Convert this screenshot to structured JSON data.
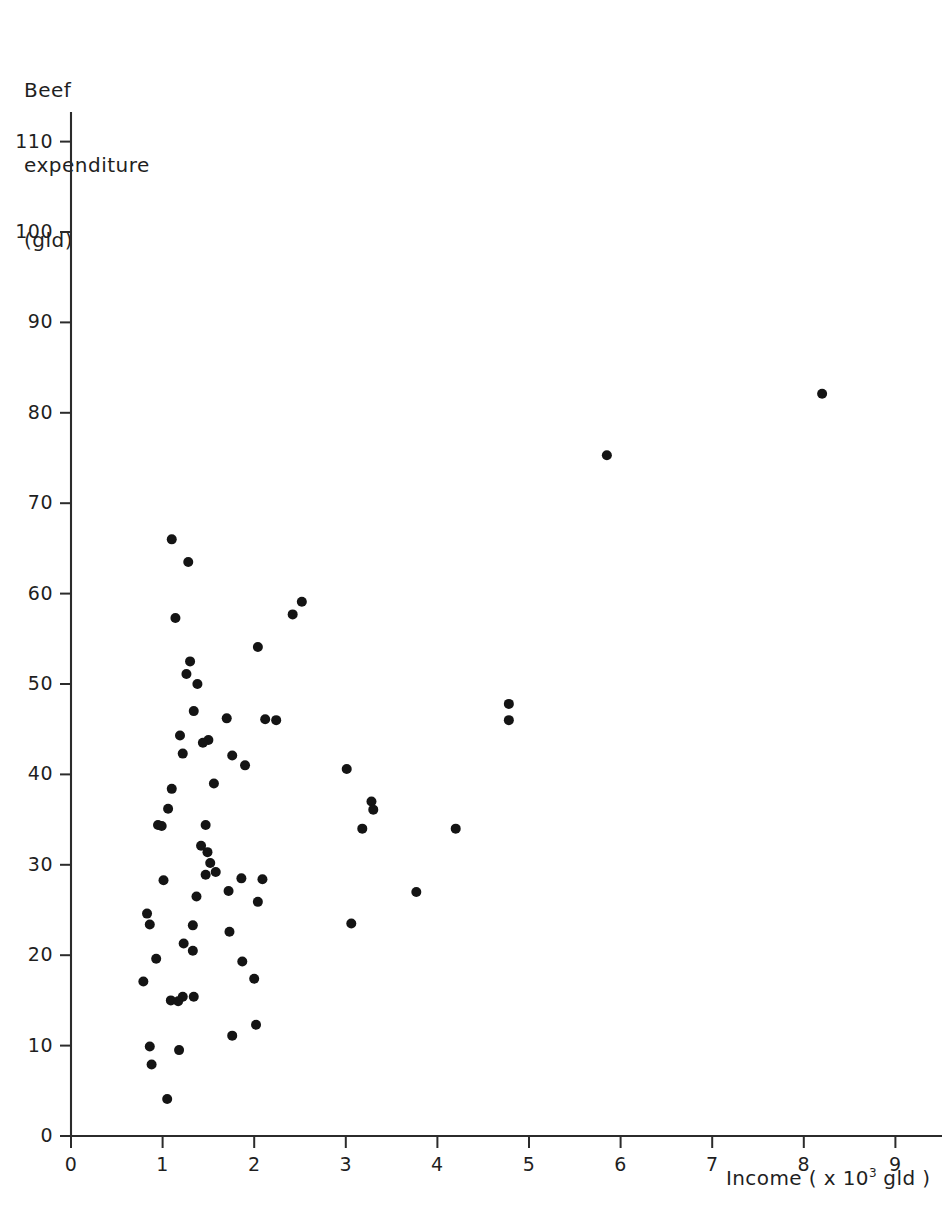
{
  "chart_data": {
    "type": "scatter",
    "title": "",
    "ylabel_lines": [
      "Beef",
      "expenditure",
      "(gld)"
    ],
    "ylabel": "Beef expenditure (gld)",
    "xlabel": "Income (x10^3 gld)",
    "xlabel_prefix": "Income ( x 10",
    "xlabel_exponent": "3",
    "xlabel_suffix": " gld )",
    "xlim": [
      0,
      9.6
    ],
    "ylim": [
      0,
      113
    ],
    "xticks": [
      0,
      1,
      2,
      3,
      4,
      5,
      6,
      7,
      8,
      9
    ],
    "yticks": [
      0,
      10,
      20,
      30,
      40,
      50,
      60,
      70,
      80,
      90,
      100,
      110
    ],
    "xtick_labels": [
      "0",
      "1",
      "2",
      "3",
      "4",
      "5",
      "6",
      "7",
      "8",
      "9"
    ],
    "ytick_labels": [
      "0",
      "10",
      "20",
      "30",
      "40",
      "50",
      "60",
      "70",
      "80",
      "90",
      "100",
      "110"
    ],
    "grid": false,
    "legend": null,
    "marker": "filled-circle",
    "marker_color": "#141414",
    "marker_radius_px": 5.0,
    "points": [
      [
        1.1,
        66.0
      ],
      [
        1.28,
        63.5
      ],
      [
        2.52,
        59.1
      ],
      [
        2.42,
        57.7
      ],
      [
        1.14,
        57.3
      ],
      [
        2.04,
        54.1
      ],
      [
        1.3,
        52.5
      ],
      [
        1.26,
        51.1
      ],
      [
        1.38,
        50.0
      ],
      [
        4.78,
        47.8
      ],
      [
        1.34,
        47.0
      ],
      [
        1.7,
        46.2
      ],
      [
        2.12,
        46.1
      ],
      [
        2.24,
        46.0
      ],
      [
        4.78,
        46.0
      ],
      [
        1.19,
        44.3
      ],
      [
        1.5,
        43.8
      ],
      [
        1.44,
        43.5
      ],
      [
        1.22,
        42.3
      ],
      [
        1.76,
        42.1
      ],
      [
        1.9,
        41.0
      ],
      [
        3.01,
        40.6
      ],
      [
        1.56,
        39.0
      ],
      [
        1.1,
        38.4
      ],
      [
        3.28,
        37.0
      ],
      [
        1.06,
        36.2
      ],
      [
        3.3,
        36.1
      ],
      [
        1.47,
        34.4
      ],
      [
        0.95,
        34.4
      ],
      [
        0.99,
        34.3
      ],
      [
        3.18,
        34.0
      ],
      [
        4.2,
        34.0
      ],
      [
        1.42,
        32.1
      ],
      [
        1.49,
        31.4
      ],
      [
        1.52,
        30.2
      ],
      [
        1.58,
        29.2
      ],
      [
        1.47,
        28.9
      ],
      [
        1.86,
        28.5
      ],
      [
        2.09,
        28.4
      ],
      [
        1.01,
        28.3
      ],
      [
        1.72,
        27.1
      ],
      [
        3.77,
        27.0
      ],
      [
        1.37,
        26.5
      ],
      [
        2.04,
        25.9
      ],
      [
        0.83,
        24.6
      ],
      [
        0.86,
        23.4
      ],
      [
        1.33,
        23.3
      ],
      [
        3.06,
        23.5
      ],
      [
        1.73,
        22.6
      ],
      [
        1.23,
        21.3
      ],
      [
        1.33,
        20.5
      ],
      [
        0.93,
        19.6
      ],
      [
        1.87,
        19.3
      ],
      [
        2.0,
        17.4
      ],
      [
        0.79,
        17.1
      ],
      [
        1.22,
        15.4
      ],
      [
        1.34,
        15.4
      ],
      [
        1.09,
        15.0
      ],
      [
        1.17,
        14.9
      ],
      [
        2.02,
        12.3
      ],
      [
        1.76,
        11.1
      ],
      [
        0.86,
        9.9
      ],
      [
        1.18,
        9.5
      ],
      [
        0.88,
        7.9
      ],
      [
        1.05,
        4.1
      ],
      [
        5.85,
        75.3
      ],
      [
        8.2,
        82.1
      ]
    ]
  },
  "axes": {
    "origin_px": {
      "x": 71,
      "y": 1136
    },
    "x_unit_px": 91.6,
    "y_unit_px": 9.04
  }
}
